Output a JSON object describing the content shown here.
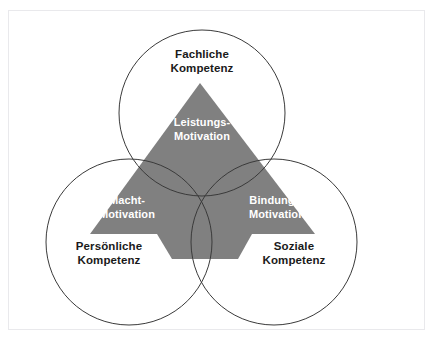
{
  "diagram": {
    "type": "venn-triangle",
    "colors": {
      "triangle_fill": "#808080",
      "circle_stroke": "#3a3a3a",
      "outer_text": "#1a1a1a",
      "inner_text": "#ffffff",
      "frame_border": "#e9e9ec",
      "background": "#ffffff"
    },
    "circles": [
      {
        "id": "fachliche",
        "label_line1": "Fachliche",
        "label_line2": "Kompetenz",
        "cx": 202,
        "cy": 113,
        "r": 83
      },
      {
        "id": "persoenliche",
        "label_line1": "Persönliche",
        "label_line2": "Kompetenz",
        "cx": 129,
        "cy": 242,
        "r": 83
      },
      {
        "id": "soziale",
        "label_line1": "Soziale",
        "label_line2": "Kompetenz",
        "cx": 274,
        "cy": 242,
        "r": 83
      }
    ],
    "triangle": {
      "apex": {
        "x": 200,
        "y": 83
      },
      "base_left": {
        "x": 90,
        "y": 234
      },
      "base_right": {
        "x": 315,
        "y": 234
      },
      "stem": {
        "top_left": {
          "x": 157,
          "y": 234
        },
        "top_right": {
          "x": 252,
          "y": 234
        },
        "bottom_left": {
          "x": 172,
          "y": 259
        },
        "bottom_right": {
          "x": 238,
          "y": 259
        }
      }
    },
    "motivations": [
      {
        "id": "leistungs",
        "label_line1": "Leistungs-",
        "label_line2": "Motivation",
        "region": "top"
      },
      {
        "id": "macht",
        "label_line1": "Macht-",
        "label_line2": "Motivation",
        "region": "bottom-left"
      },
      {
        "id": "bindungs",
        "label_line1": "Bindungs-",
        "label_line2": "Motivation",
        "region": "bottom-right"
      }
    ]
  }
}
